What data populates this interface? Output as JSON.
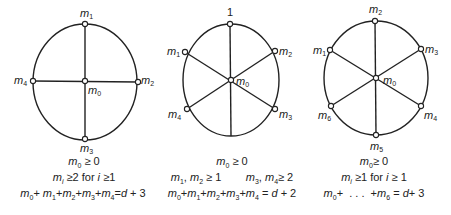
{
  "diagrams": [
    {
      "id": "four-spoke",
      "labels": {
        "top": "m1",
        "right": "m2",
        "bottom": "m3",
        "left": "m4",
        "center": "m0"
      },
      "conditions": [
        "m0 ≥ 0",
        "mi ≥ 2 for i ≥ 1",
        "m0+ m1+m2+m3+m4 = d + 3"
      ]
    },
    {
      "id": "six-spoke-top-one",
      "labels": {
        "top": "1",
        "upper_left": "m1",
        "upper_right": "m2",
        "lower_right": "m3",
        "lower_left": "m4",
        "center": "m0"
      },
      "conditions": [
        "m0 ≥ 0",
        "m1, m2 ≥ 1        m3, m4 ≥ 2",
        "m0+m1+m2+m3+m4 = d + 2"
      ]
    },
    {
      "id": "six-spoke",
      "labels": {
        "top": "m2",
        "upper_right": "m3",
        "lower_right": "m4",
        "bottom": "m5",
        "lower_left": "m6",
        "upper_left": "m1",
        "center": "m0"
      },
      "conditions": [
        "m0 ≥ 0",
        "mi ≥1 for i ≥ 1",
        "m0+ ... +m6 = d + 3"
      ]
    }
  ],
  "style": {
    "line_color": "#222222",
    "background": "#ffffff"
  }
}
